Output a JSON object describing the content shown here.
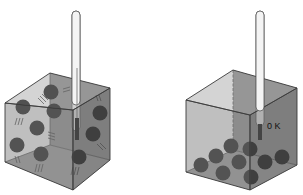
{
  "figure": {
    "colors": {
      "background": "#ffffff",
      "box_face_front": "#8a8a8a",
      "box_face_side": "#6e6e6e",
      "box_face_top": "#9a9a9a",
      "edge": "#3a3a3a",
      "particle": "#111111",
      "thermometer_glass": "#f4f4f4",
      "thermometer_liquid": "#1a1a1a"
    },
    "panels": [
      {
        "id": "moving-particles",
        "state": "particles in motion (with motion lines)",
        "particle_count": 10
      },
      {
        "id": "absolute-zero",
        "state": "particles at rest on floor",
        "particle_count": 10,
        "temperature_label": "0 K"
      }
    ]
  }
}
